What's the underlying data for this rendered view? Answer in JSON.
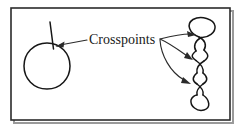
{
  "figure": {
    "kind": "line-diagram",
    "background_color": "#ffffff",
    "ink_color": "#161616",
    "frame": {
      "name": "figure-border",
      "x": 11,
      "y": 8,
      "width": 219,
      "height": 112,
      "stroke_color": "#2b2b2b",
      "shadow_color": "#9a9a9a"
    },
    "label": {
      "text": "Crosspoints",
      "x": 89,
      "y": 44,
      "font_size_px": 14,
      "color": "#1a1a1a"
    },
    "shapes": [
      {
        "name": "circle-with-tail",
        "description": "single closed loop with a short tail crossing itself once",
        "center_x": 47,
        "center_y": 66,
        "radius": 23,
        "crosspoint_count": 1
      },
      {
        "name": "loop-chain",
        "description": "vertical chain of four loops forming three self-crossings",
        "center_x": 201,
        "top_y": 18,
        "bottom_y": 110,
        "loop_count": 4,
        "crosspoint_count": 3
      }
    ],
    "crosspoints": [
      {
        "name": "crosspoint-circle",
        "x": 55,
        "y": 45
      },
      {
        "name": "crosspoint-chain-top",
        "x": 200,
        "y": 37
      },
      {
        "name": "crosspoint-chain-middle",
        "x": 200,
        "y": 60
      },
      {
        "name": "crosspoint-chain-bottom",
        "x": 200,
        "y": 84
      }
    ],
    "arrows": [
      {
        "name": "arrow-to-circle-crosspoint",
        "from_x": 86,
        "from_y": 40,
        "to_x": 57,
        "to_y": 46
      },
      {
        "name": "arrow-to-chain-top",
        "from_x": 160,
        "from_y": 39,
        "to_x": 194,
        "to_y": 35
      },
      {
        "name": "arrow-to-chain-middle",
        "from_x": 160,
        "from_y": 39,
        "to_x": 192,
        "to_y": 59
      },
      {
        "name": "arrow-to-chain-bottom",
        "from_x": 160,
        "from_y": 39,
        "to_x": 191,
        "to_y": 83
      }
    ]
  }
}
